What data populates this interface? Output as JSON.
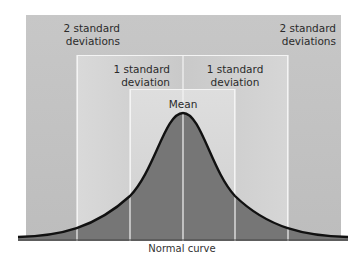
{
  "diagram": {
    "title": "Normal curve",
    "labels": {
      "two_sd_left": "2 standard\ndeviations",
      "two_sd_right": "2 standard\ndeviations",
      "one_sd_left": "1 standard\ndeviation",
      "one_sd_right": "1 standard\ndeviation",
      "mean": "Mean"
    },
    "caption": "Normal curve",
    "regions": [
      {
        "name": "two-standard-deviations",
        "x_range": [
          26,
          341
        ]
      },
      {
        "name": "one-standard-deviation",
        "x_range": [
          77,
          288
        ]
      },
      {
        "name": "mean-band",
        "x_range": [
          130,
          235
        ]
      }
    ],
    "mean_line_x": 183,
    "colors": {
      "outer_band": "#c2c2c2",
      "middle_band": "#d2d2d2",
      "inner_band": "#d8d8d8",
      "curve_fill": "#767676",
      "curve_stroke": "#111111",
      "divider": "#f4f4f4"
    }
  }
}
